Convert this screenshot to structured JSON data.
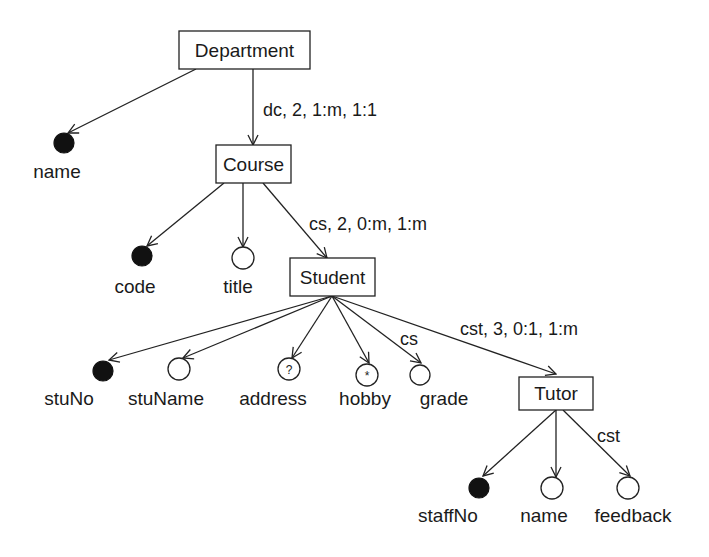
{
  "diagram": {
    "nodes": {
      "department": "Department",
      "course": "Course",
      "student": "Student",
      "tutor": "Tutor"
    },
    "attributes": {
      "dept_name": {
        "label": "name",
        "type": "key"
      },
      "code": {
        "label": "code",
        "type": "key"
      },
      "title": {
        "label": "title",
        "type": "simple"
      },
      "stuNo": {
        "label": "stuNo",
        "type": "key"
      },
      "stuName": {
        "label": "stuName",
        "type": "simple"
      },
      "address": {
        "label": "address",
        "type": "optional",
        "glyph": "?"
      },
      "hobby": {
        "label": "hobby",
        "type": "multivalued",
        "glyph": "*"
      },
      "grade": {
        "label": "grade",
        "type": "simple"
      },
      "staffNo": {
        "label": "staffNo",
        "type": "key"
      },
      "tutor_name": {
        "label": "name",
        "type": "simple"
      },
      "feedback": {
        "label": "feedback",
        "type": "simple"
      }
    },
    "edge_labels": {
      "dept_course": "dc, 2, 1:m, 1:1",
      "course_student": "cs, 2, 0:m, 1:m",
      "student_grade": "cs",
      "student_tutor": "cst, 3, 0:1, 1:m",
      "tutor_feedback": "cst"
    }
  }
}
